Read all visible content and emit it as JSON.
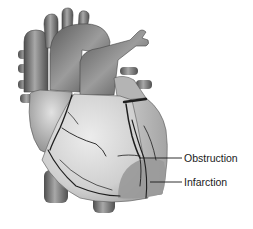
{
  "figure": {
    "labels": [
      {
        "id": "obstruction",
        "text": "Obstruction",
        "x": 184,
        "y": 151
      },
      {
        "id": "infarction",
        "text": "Infarction",
        "x": 184,
        "y": 177
      }
    ],
    "colors": {
      "background": "#ffffff",
      "vessel_dark": "#5a5a5a",
      "vessel_mid": "#8a8a8a",
      "vessel_light": "#c4c4c4",
      "myocardium": "#d6d6d6",
      "myocardium_light": "#e8e8e8",
      "infarct": "#9a9a9a",
      "artery_line": "#1e1e1e",
      "label_text": "#1a1a1a"
    }
  }
}
